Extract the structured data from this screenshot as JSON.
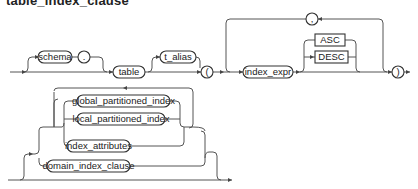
{
  "diagram": {
    "title": "table_index_clause",
    "type": "railroad-syntax-diagram",
    "nodes": {
      "schema": "schema",
      "dot": ".",
      "table": "table",
      "t_alias": "t_alias",
      "lparen": "(",
      "index_expr": "index_expr",
      "asc": "ASC",
      "desc": "DESC",
      "comma": ",",
      "rparen": ")",
      "global_partitioned_index": "global_partitioned_index",
      "local_partitioned_index": "local_partitioned_index",
      "index_attributes": "index_attributes",
      "domain_index_clause": "domain_index_clause"
    },
    "keyword_nodes": [
      "ASC",
      "DESC"
    ],
    "colors": {
      "line": "#555555",
      "box_stroke": "#333333",
      "text": "#222222",
      "background": "#ffffff"
    }
  }
}
